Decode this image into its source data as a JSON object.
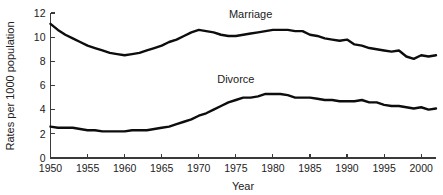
{
  "chart_data": {
    "type": "line",
    "title": "",
    "xlabel": "Year",
    "ylabel": "Rates per 1000 population",
    "xlim": [
      1950,
      2002
    ],
    "ylim": [
      0,
      12
    ],
    "xticks": [
      1950,
      1955,
      1960,
      1965,
      1970,
      1975,
      1980,
      1985,
      1990,
      1995,
      2000
    ],
    "yticks": [
      0,
      2,
      4,
      6,
      8,
      10,
      12
    ],
    "grid": false,
    "legend_position": "inline-annotation",
    "series": [
      {
        "name": "Marriage",
        "label_x": 1977,
        "label_y": 11.6,
        "color": "#0d0d0d",
        "x": [
          1950,
          1951,
          1952,
          1953,
          1954,
          1955,
          1956,
          1957,
          1958,
          1959,
          1960,
          1961,
          1962,
          1963,
          1964,
          1965,
          1966,
          1967,
          1968,
          1969,
          1970,
          1971,
          1972,
          1973,
          1974,
          1975,
          1976,
          1977,
          1978,
          1979,
          1980,
          1981,
          1982,
          1983,
          1984,
          1985,
          1986,
          1987,
          1988,
          1989,
          1990,
          1991,
          1992,
          1993,
          1994,
          1995,
          1996,
          1997,
          1998,
          1999,
          2000,
          2001,
          2002
        ],
        "values": [
          11.1,
          10.6,
          10.2,
          9.9,
          9.6,
          9.3,
          9.1,
          8.9,
          8.7,
          8.6,
          8.5,
          8.6,
          8.7,
          8.9,
          9.1,
          9.3,
          9.6,
          9.8,
          10.1,
          10.4,
          10.6,
          10.5,
          10.4,
          10.2,
          10.1,
          10.1,
          10.2,
          10.3,
          10.4,
          10.5,
          10.6,
          10.6,
          10.6,
          10.5,
          10.5,
          10.2,
          10.1,
          9.9,
          9.8,
          9.7,
          9.8,
          9.4,
          9.3,
          9.1,
          9.0,
          8.9,
          8.8,
          8.9,
          8.4,
          8.2,
          8.5,
          8.4,
          8.5
        ]
      },
      {
        "name": "Divorce",
        "label_x": 1975,
        "label_y": 6.2,
        "color": "#0d0d0d",
        "x": [
          1950,
          1951,
          1952,
          1953,
          1954,
          1955,
          1956,
          1957,
          1958,
          1959,
          1960,
          1961,
          1962,
          1963,
          1964,
          1965,
          1966,
          1967,
          1968,
          1969,
          1970,
          1971,
          1972,
          1973,
          1974,
          1975,
          1976,
          1977,
          1978,
          1979,
          1980,
          1981,
          1982,
          1983,
          1984,
          1985,
          1986,
          1987,
          1988,
          1989,
          1990,
          1991,
          1992,
          1993,
          1994,
          1995,
          1996,
          1997,
          1998,
          1999,
          2000,
          2001,
          2002
        ],
        "values": [
          2.6,
          2.5,
          2.5,
          2.5,
          2.4,
          2.3,
          2.3,
          2.2,
          2.2,
          2.2,
          2.2,
          2.3,
          2.3,
          2.3,
          2.4,
          2.5,
          2.6,
          2.8,
          3.0,
          3.2,
          3.5,
          3.7,
          4.0,
          4.3,
          4.6,
          4.8,
          5.0,
          5.0,
          5.1,
          5.3,
          5.3,
          5.3,
          5.2,
          5.0,
          5.0,
          5.0,
          4.9,
          4.8,
          4.8,
          4.7,
          4.7,
          4.7,
          4.8,
          4.6,
          4.6,
          4.4,
          4.3,
          4.3,
          4.2,
          4.1,
          4.2,
          4.0,
          4.1
        ]
      }
    ]
  }
}
